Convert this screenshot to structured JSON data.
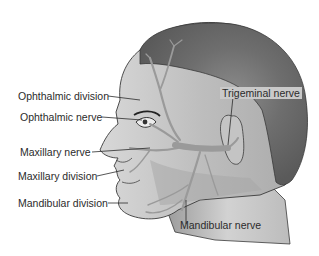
{
  "diagram": {
    "labels": {
      "ophthalmic_division": "Ophthalmic division",
      "ophthalmic_nerve": "Ophthalmic nerve",
      "maxillary_nerve": "Maxillary nerve",
      "maxillary_division": "Maxillary division",
      "mandibular_division": "Mandibular division",
      "trigeminal_nerve": "Trigeminal nerve",
      "mandibular_nerve": "Mandibular nerve"
    },
    "colors": {
      "hair": "#7a7a7a",
      "skin": "#b8b8b8",
      "skin_light": "#d6d6d6",
      "nerve": "#9e9e9e",
      "outline": "#3a3a3a",
      "label_box": "#c9c9c9",
      "text": "#2b2b2b"
    }
  }
}
